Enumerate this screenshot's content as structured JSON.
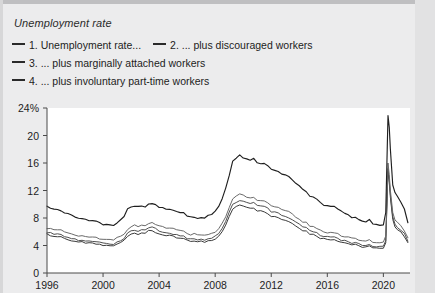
{
  "chart_title": "Unemployment rate",
  "legend": {
    "entries": [
      {
        "id": "series-1",
        "label": "1. Unemployment rate...",
        "color": "#333333"
      },
      {
        "id": "series-2",
        "label": "2. ... plus discouraged workers",
        "color": "#4a4a4a"
      },
      {
        "id": "series-3",
        "label": "3. ... plus marginally attached workers",
        "color": "#606060"
      },
      {
        "id": "series-4",
        "label": "4. ... plus involuntary part-time workers",
        "color": "#2b2b2b"
      }
    ]
  },
  "axes": {
    "y_ticks": [
      "0",
      "4",
      "8",
      "12",
      "16",
      "20",
      "24%"
    ],
    "x_ticks": [
      "1996",
      "2000",
      "2004",
      "2008",
      "2012",
      "2016",
      "2020"
    ]
  },
  "chart_data": {
    "type": "line",
    "title": "Unemployment rate",
    "xlabel": "",
    "ylabel": "",
    "ylim": [
      0,
      24
    ],
    "xlim": [
      1996,
      2021.9
    ],
    "grid": false,
    "legend_position": "top-left",
    "x_tick_values": [
      1996,
      2000,
      2004,
      2008,
      2012,
      2016,
      2020
    ],
    "y_tick_values": [
      0,
      4,
      8,
      12,
      16,
      20,
      24
    ],
    "x": [
      1996.0,
      1996.25,
      1996.5,
      1996.75,
      1997.0,
      1997.25,
      1997.5,
      1997.75,
      1998.0,
      1998.25,
      1998.5,
      1998.75,
      1999.0,
      1999.25,
      1999.5,
      1999.75,
      2000.0,
      2000.25,
      2000.5,
      2000.75,
      2001.0,
      2001.25,
      2001.5,
      2001.75,
      2002.0,
      2002.25,
      2002.5,
      2002.75,
      2003.0,
      2003.25,
      2003.5,
      2003.75,
      2004.0,
      2004.25,
      2004.5,
      2004.75,
      2005.0,
      2005.25,
      2005.5,
      2005.75,
      2006.0,
      2006.25,
      2006.5,
      2006.75,
      2007.0,
      2007.25,
      2007.5,
      2007.75,
      2008.0,
      2008.25,
      2008.5,
      2008.75,
      2009.0,
      2009.25,
      2009.5,
      2009.75,
      2010.0,
      2010.25,
      2010.5,
      2010.75,
      2011.0,
      2011.25,
      2011.5,
      2011.75,
      2012.0,
      2012.25,
      2012.5,
      2012.75,
      2013.0,
      2013.25,
      2013.5,
      2013.75,
      2014.0,
      2014.25,
      2014.5,
      2014.75,
      2015.0,
      2015.25,
      2015.5,
      2015.75,
      2016.0,
      2016.25,
      2016.5,
      2016.75,
      2017.0,
      2017.25,
      2017.5,
      2017.75,
      2018.0,
      2018.25,
      2018.5,
      2018.75,
      2019.0,
      2019.25,
      2019.5,
      2019.75,
      2020.0,
      2020.17,
      2020.33,
      2020.42,
      2020.5,
      2020.67,
      2020.83,
      2021.0,
      2021.25,
      2021.5,
      2021.75
    ],
    "series": [
      {
        "name": "1. Unemployment rate...",
        "color": "#3a3a3a",
        "values": [
          5.6,
          5.5,
          5.3,
          5.3,
          5.3,
          5.0,
          4.9,
          4.7,
          4.6,
          4.4,
          4.5,
          4.4,
          4.3,
          4.3,
          4.2,
          4.1,
          4.0,
          4.0,
          4.0,
          3.9,
          4.2,
          4.4,
          4.8,
          5.4,
          5.7,
          5.8,
          5.7,
          5.9,
          5.8,
          6.1,
          6.1,
          5.9,
          5.7,
          5.6,
          5.4,
          5.4,
          5.3,
          5.1,
          5.0,
          5.0,
          4.7,
          4.6,
          4.7,
          4.5,
          4.6,
          4.5,
          4.7,
          4.8,
          5.0,
          5.4,
          6.1,
          6.9,
          8.2,
          9.3,
          9.6,
          9.9,
          9.8,
          9.6,
          9.5,
          9.5,
          9.1,
          9.0,
          9.0,
          8.7,
          8.3,
          8.2,
          8.1,
          7.8,
          7.7,
          7.5,
          7.2,
          6.9,
          6.6,
          6.2,
          6.1,
          5.7,
          5.6,
          5.4,
          5.1,
          5.0,
          4.9,
          4.9,
          4.9,
          4.7,
          4.5,
          4.4,
          4.3,
          4.1,
          4.1,
          3.9,
          3.8,
          3.8,
          3.9,
          3.6,
          3.6,
          3.5,
          3.6,
          4.4,
          14.8,
          13.2,
          11.0,
          7.8,
          6.7,
          6.3,
          5.9,
          5.3,
          4.4
        ]
      },
      {
        "name": "2. ... plus discouraged workers",
        "color": "#4f4f4f",
        "values": [
          5.9,
          5.8,
          5.6,
          5.6,
          5.6,
          5.3,
          5.2,
          5.0,
          4.9,
          4.7,
          4.8,
          4.7,
          4.6,
          4.6,
          4.5,
          4.4,
          4.3,
          4.3,
          4.3,
          4.2,
          4.5,
          4.7,
          5.1,
          5.8,
          6.1,
          6.2,
          6.1,
          6.3,
          6.2,
          6.5,
          6.6,
          6.4,
          6.1,
          6.0,
          5.8,
          5.8,
          5.7,
          5.5,
          5.4,
          5.4,
          5.0,
          4.9,
          5.0,
          4.8,
          4.9,
          4.8,
          5.0,
          5.1,
          5.4,
          5.8,
          6.6,
          7.4,
          8.8,
          9.9,
          10.3,
          10.6,
          10.5,
          10.3,
          10.2,
          10.2,
          9.8,
          9.7,
          9.7,
          9.4,
          8.9,
          8.8,
          8.7,
          8.4,
          8.3,
          8.1,
          7.8,
          7.4,
          7.1,
          6.7,
          6.6,
          6.1,
          6.0,
          5.8,
          5.5,
          5.4,
          5.3,
          5.3,
          5.3,
          5.1,
          4.8,
          4.7,
          4.6,
          4.4,
          4.4,
          4.2,
          4.1,
          4.1,
          4.2,
          3.9,
          3.9,
          3.8,
          3.9,
          4.7,
          15.2,
          13.6,
          11.4,
          8.2,
          7.1,
          6.7,
          6.3,
          5.7,
          4.7
        ]
      },
      {
        "name": "3. ... plus marginally attached workers",
        "color": "#6a6a6a",
        "values": [
          6.5,
          6.4,
          6.2,
          6.2,
          6.2,
          5.9,
          5.8,
          5.6,
          5.5,
          5.3,
          5.4,
          5.3,
          5.2,
          5.2,
          5.1,
          5.0,
          4.9,
          4.9,
          4.9,
          4.8,
          5.1,
          5.3,
          5.7,
          6.4,
          6.8,
          6.9,
          6.8,
          7.0,
          6.9,
          7.2,
          7.3,
          7.1,
          6.8,
          6.7,
          6.5,
          6.5,
          6.4,
          6.2,
          6.1,
          6.1,
          5.7,
          5.6,
          5.7,
          5.5,
          5.5,
          5.4,
          5.6,
          5.7,
          6.0,
          6.4,
          7.3,
          8.2,
          9.6,
          10.7,
          11.1,
          11.4,
          11.3,
          11.1,
          11.0,
          11.0,
          10.6,
          10.5,
          10.5,
          10.2,
          9.7,
          9.6,
          9.5,
          9.2,
          9.1,
          8.9,
          8.5,
          8.1,
          7.8,
          7.4,
          7.3,
          6.8,
          6.7,
          6.5,
          6.2,
          6.0,
          5.9,
          5.9,
          5.9,
          5.7,
          5.4,
          5.3,
          5.2,
          5.0,
          5.0,
          4.8,
          4.7,
          4.7,
          4.8,
          4.5,
          4.5,
          4.4,
          4.5,
          5.4,
          16.0,
          14.3,
          12.0,
          8.8,
          7.7,
          7.3,
          6.8,
          6.2,
          5.2
        ]
      },
      {
        "name": "4. ... plus involuntary part-time workers",
        "color": "#1f1f1f",
        "values": [
          9.7,
          9.5,
          9.3,
          9.2,
          9.1,
          8.8,
          8.6,
          8.4,
          8.2,
          8.0,
          8.0,
          7.9,
          7.7,
          7.7,
          7.5,
          7.4,
          7.1,
          7.0,
          7.0,
          6.9,
          7.3,
          7.7,
          8.3,
          9.3,
          9.6,
          9.7,
          9.6,
          9.8,
          9.7,
          10.1,
          10.2,
          9.9,
          9.6,
          9.5,
          9.3,
          9.3,
          9.1,
          8.9,
          8.8,
          8.7,
          8.2,
          8.1,
          8.2,
          8.0,
          8.1,
          8.0,
          8.3,
          8.5,
          9.0,
          9.7,
          10.9,
          12.4,
          14.2,
          16.2,
          16.6,
          17.1,
          16.8,
          16.6,
          16.5,
          16.6,
          16.1,
          15.9,
          16.0,
          15.6,
          15.1,
          14.9,
          14.7,
          14.4,
          14.3,
          14.0,
          13.6,
          13.1,
          12.7,
          12.1,
          11.8,
          11.2,
          11.0,
          10.8,
          10.3,
          9.9,
          9.8,
          9.7,
          9.7,
          9.3,
          8.9,
          8.6,
          8.5,
          8.1,
          8.1,
          7.8,
          7.5,
          7.5,
          7.7,
          7.2,
          7.0,
          6.9,
          7.0,
          8.8,
          22.9,
          21.2,
          18.0,
          12.8,
          11.7,
          11.1,
          10.2,
          9.2,
          7.3
        ]
      }
    ]
  }
}
